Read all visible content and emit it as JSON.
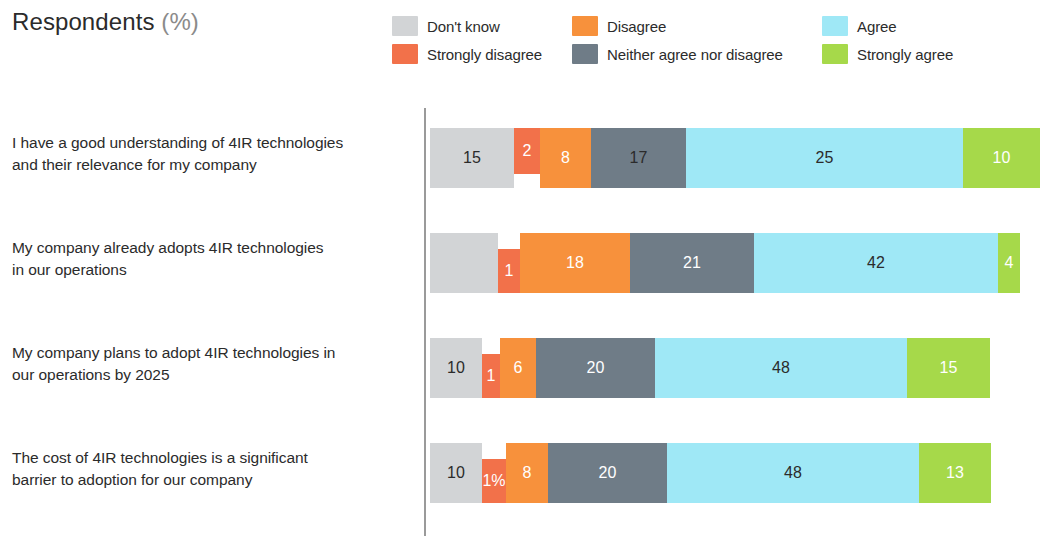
{
  "header": {
    "title_main": "Respondents",
    "title_unit": "(%)"
  },
  "legend": {
    "items": [
      {
        "label": "Don't know",
        "color": "#d2d4d6",
        "key": "dont_know"
      },
      {
        "label": "Disagree",
        "color": "#f7913c",
        "key": "disagree"
      },
      {
        "label": "Agree",
        "color": "#9fe8f6",
        "key": "agree"
      },
      {
        "label": "Strongly disagree",
        "color": "#f2714a",
        "key": "strongly_disagree"
      },
      {
        "label": "Neither agree nor disagree",
        "color": "#6f7c87",
        "key": "neither"
      },
      {
        "label": "Strongly agree",
        "color": "#a6d94a",
        "key": "strongly_agree"
      }
    ]
  },
  "chart_data": {
    "type": "bar",
    "subtype": "stacked-horizontal-100",
    "title": "Respondents (%)",
    "xlabel": "",
    "ylabel": "",
    "xlim": [
      0,
      100
    ],
    "grid": false,
    "legend_position": "top-right",
    "categories": [
      "I have a good understanding of 4IR technologies and their relevance for my company",
      "My company already adopts 4IR technologies in our operations",
      "My company plans to adopt 4IR technologies in our operations by 2025",
      "The cost of 4IR technologies is a significant barrier to adoption for our company"
    ],
    "series": [
      {
        "name": "Don't know",
        "color": "#d2d4d6",
        "values": [
          15,
          14,
          10,
          10
        ]
      },
      {
        "name": "Strongly disagree",
        "color": "#f2714a",
        "values": [
          2,
          1,
          1,
          1
        ]
      },
      {
        "name": "Disagree",
        "color": "#f7913c",
        "values": [
          8,
          18,
          6,
          8
        ]
      },
      {
        "name": "Neither agree nor disagree",
        "color": "#6f7c87",
        "values": [
          17,
          21,
          20,
          20
        ]
      },
      {
        "name": "Agree",
        "color": "#9fe8f6",
        "values": [
          25,
          42,
          48,
          48
        ]
      },
      {
        "name": "Strongly agree",
        "color": "#a6d94a",
        "values": [
          10,
          4,
          15,
          13
        ]
      }
    ]
  },
  "rows": [
    {
      "label_line1": "I have a good understanding of 4IR technologies",
      "label_line2": "and their relevance for my company",
      "segments": [
        {
          "key": "dont_know",
          "value": 15,
          "display": "15",
          "width_px": 84,
          "color": "#d2d4d6",
          "text": "dark"
        },
        {
          "key": "strongly_disagree",
          "value": 2,
          "display": "2",
          "width_px": 26,
          "color": "#f2714a",
          "text": "light"
        },
        {
          "key": "disagree",
          "value": 8,
          "display": "8",
          "width_px": 51,
          "color": "#f7913c",
          "text": "light"
        },
        {
          "key": "neither",
          "value": 17,
          "display": "17",
          "width_px": 95,
          "color": "#6f7c87",
          "text": "dark"
        },
        {
          "key": "agree",
          "value": 25,
          "display": "25",
          "width_px": 277,
          "color": "#9fe8f6",
          "text": "dark"
        },
        {
          "key": "strongly_agree",
          "value": 10,
          "display": "10",
          "width_px": 77,
          "color": "#a6d94a",
          "text": "light"
        }
      ]
    },
    {
      "label_line1": "My company already adopts 4IR technologies",
      "label_line2": "in our operations",
      "segments": [
        {
          "key": "dont_know",
          "value": 14,
          "display": "",
          "width_px": 68,
          "color": "#d2d4d6",
          "text": "dark"
        },
        {
          "key": "strongly_disagree",
          "value": 1,
          "display": "1",
          "width_px": 22,
          "color": "#f2714a",
          "text": "light"
        },
        {
          "key": "disagree",
          "value": 18,
          "display": "18",
          "width_px": 110,
          "color": "#f7913c",
          "text": "light"
        },
        {
          "key": "neither",
          "value": 21,
          "display": "21",
          "width_px": 124,
          "color": "#6f7c87",
          "text": "light"
        },
        {
          "key": "agree",
          "value": 42,
          "display": "42",
          "width_px": 244,
          "color": "#9fe8f6",
          "text": "dark"
        },
        {
          "key": "strongly_agree",
          "value": 4,
          "display": "4",
          "width_px": 22,
          "color": "#a6d94a",
          "text": "light"
        }
      ]
    },
    {
      "label_line1": "My company plans to adopt 4IR technologies in",
      "label_line2": "our operations by 2025",
      "segments": [
        {
          "key": "dont_know",
          "value": 10,
          "display": "10",
          "width_px": 52,
          "color": "#d2d4d6",
          "text": "dark"
        },
        {
          "key": "strongly_disagree",
          "value": 1,
          "display": "1",
          "width_px": 18,
          "color": "#f2714a",
          "text": "light"
        },
        {
          "key": "disagree",
          "value": 6,
          "display": "6",
          "width_px": 36,
          "color": "#f7913c",
          "text": "light"
        },
        {
          "key": "neither",
          "value": 20,
          "display": "20",
          "width_px": 119,
          "color": "#6f7c87",
          "text": "light"
        },
        {
          "key": "agree",
          "value": 48,
          "display": "48",
          "width_px": 252,
          "color": "#9fe8f6",
          "text": "dark"
        },
        {
          "key": "strongly_agree",
          "value": 15,
          "display": "15",
          "width_px": 83,
          "color": "#a6d94a",
          "text": "light"
        }
      ]
    },
    {
      "label_line1": "The cost of 4IR technologies is a significant",
      "label_line2": "barrier to adoption for our company",
      "segments": [
        {
          "key": "dont_know",
          "value": 10,
          "display": "10",
          "width_px": 52,
          "color": "#d2d4d6",
          "text": "dark"
        },
        {
          "key": "strongly_disagree",
          "value": 1,
          "display": "1%",
          "width_px": 24,
          "color": "#f2714a",
          "text": "light"
        },
        {
          "key": "disagree",
          "value": 8,
          "display": "8",
          "width_px": 42,
          "color": "#f7913c",
          "text": "light"
        },
        {
          "key": "neither",
          "value": 20,
          "display": "20",
          "width_px": 119,
          "color": "#6f7c87",
          "text": "light"
        },
        {
          "key": "agree",
          "value": 48,
          "display": "48",
          "width_px": 252,
          "color": "#9fe8f6",
          "text": "dark"
        },
        {
          "key": "strongly_agree",
          "value": 13,
          "display": "13",
          "width_px": 72,
          "color": "#a6d94a",
          "text": "light"
        }
      ]
    }
  ]
}
